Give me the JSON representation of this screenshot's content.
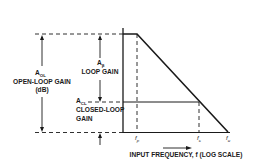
{
  "diagram": {
    "y_axis": {
      "open_loop_gain": {
        "symbol": "A",
        "subscript": "OL",
        "label": "OPEN-LOOP GAIN",
        "unit": "(dB)"
      },
      "loop_gain": {
        "symbol": "A",
        "subscript": "β",
        "label": "LOOP GAIN"
      },
      "closed_loop_gain": {
        "symbol": "A",
        "subscript": "CL",
        "label_line1": "CLOSED-LOOP",
        "label_line2": "GAIN"
      }
    },
    "x_axis": {
      "label": "INPUT FREQUENCY, f (LOG SCALE)",
      "ticks": [
        {
          "symbol": "f",
          "subscript": "p"
        },
        {
          "symbol": "f",
          "subscript": "c"
        },
        {
          "symbol": "f",
          "subscript": "u"
        }
      ]
    },
    "colors": {
      "line": "#1a1a1a",
      "background": "#ffffff"
    }
  }
}
